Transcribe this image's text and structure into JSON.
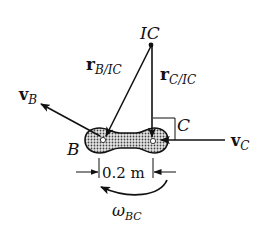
{
  "diagram": {
    "type": "rigid-body kinematics: instantaneous center of zero velocity",
    "points": {
      "ic": {
        "label": "IC"
      },
      "b": {
        "label": "B"
      },
      "c": {
        "label": "C"
      }
    },
    "vectors": {
      "r_b_ic": {
        "symbol": "r",
        "subscript": "B/IC"
      },
      "r_c_ic": {
        "symbol": "r",
        "subscript": "C/IC"
      },
      "v_b": {
        "symbol": "v",
        "subscript": "B"
      },
      "v_c": {
        "symbol": "v",
        "subscript": "C"
      }
    },
    "dimension": {
      "label": "0.2 m"
    },
    "angular_velocity": {
      "symbol": "ω",
      "subscript": "BC"
    },
    "colors": {
      "ink": "#111111",
      "background": "#ffffff",
      "hatch_fill": "#bdbdbd"
    }
  }
}
